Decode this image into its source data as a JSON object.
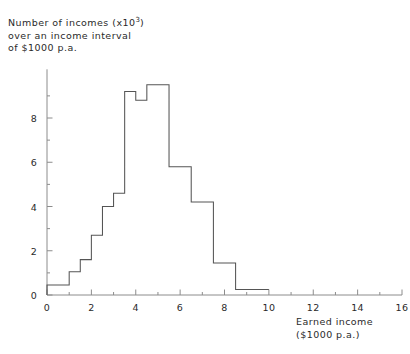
{
  "chart_data": {
    "type": "bar",
    "title": "",
    "ylabel": "Number of incomes (x10³) over an income interval of $1000 p.a.",
    "xlabel": "Earned income ($1000 p.a.)",
    "xlim": [
      0,
      16
    ],
    "ylim": [
      0,
      10.2
    ],
    "grid": false,
    "legend": null,
    "bin_width": 0.5,
    "bin_edges": [
      0,
      0.5,
      1,
      1.5,
      2,
      2.5,
      3,
      3.5,
      4,
      4.5,
      5,
      5.5,
      6,
      6.5,
      7,
      7.5,
      8,
      8.5,
      9,
      9.5,
      10
    ],
    "values": [
      0.45,
      0.45,
      1.05,
      1.6,
      2.7,
      4.0,
      4.6,
      9.2,
      8.8,
      9.5,
      9.5,
      5.8,
      5.8,
      4.2,
      4.2,
      1.45,
      1.45,
      0.25,
      0.25,
      0.25
    ],
    "xticks_major": [
      0,
      2,
      4,
      6,
      8,
      10,
      12,
      14,
      16
    ],
    "xticks_minor": [
      1,
      3,
      5,
      7,
      9,
      11,
      13,
      15
    ],
    "yticks_major": [
      0,
      2,
      4,
      6,
      8
    ],
    "yticks_minor": [
      1,
      3,
      5,
      7,
      9
    ],
    "xtick_labels": [
      "0",
      "2",
      "4",
      "6",
      "8",
      "10",
      "12",
      "14",
      "16"
    ],
    "ytick_labels": [
      "0",
      "2",
      "4",
      "6",
      "8"
    ]
  },
  "caption": {
    "y_line1": "Number of incomes (x10",
    "y_exp": "3",
    "y_line1_end": ")",
    "y_line2": "over an income interval",
    "y_line3": "of $1000 p.a.",
    "x_line1": "Earned income",
    "x_line2": "($1000 p.a.)"
  },
  "style": {
    "line_color": "#555555",
    "axis_color": "#8c8c8c",
    "background": "#ffffff"
  }
}
